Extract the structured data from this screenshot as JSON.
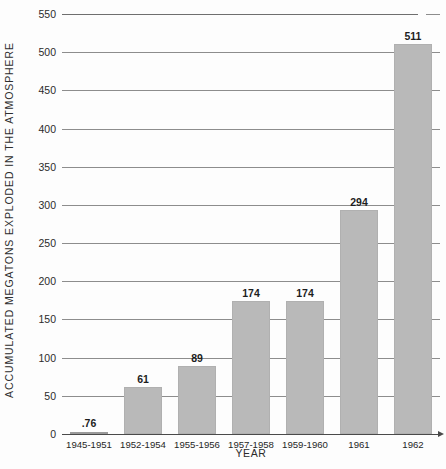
{
  "chart_data": {
    "type": "bar",
    "title": "",
    "xlabel": "YEAR",
    "ylabel": "ACCUMULATED MEGATONS EXPLODED IN THE ATMOSPHERE",
    "categories": [
      "1945-1951",
      "1952-1954",
      "1955-1956",
      "1957-1958",
      "1959-1960",
      "1961",
      "1962"
    ],
    "values": [
      0.76,
      61,
      89,
      174,
      174,
      294,
      511
    ],
    "value_labels": [
      ".76",
      "61",
      "89",
      "174",
      "174",
      "294",
      "511"
    ],
    "ylim": [
      0,
      550
    ],
    "yticks": [
      0,
      50,
      100,
      150,
      200,
      250,
      300,
      350,
      400,
      450,
      500,
      550
    ],
    "ytick_labels": [
      "0",
      "50",
      "100",
      "150",
      "200",
      "250",
      "300",
      "350",
      "400",
      "450",
      "500",
      "550"
    ],
    "grid": true,
    "legend": false,
    "bar_color": "#b9b9b9",
    "gridline_color": "#8d8d8d",
    "axis_color": "#4a4a4a",
    "background_color": "#fdfdfd"
  }
}
